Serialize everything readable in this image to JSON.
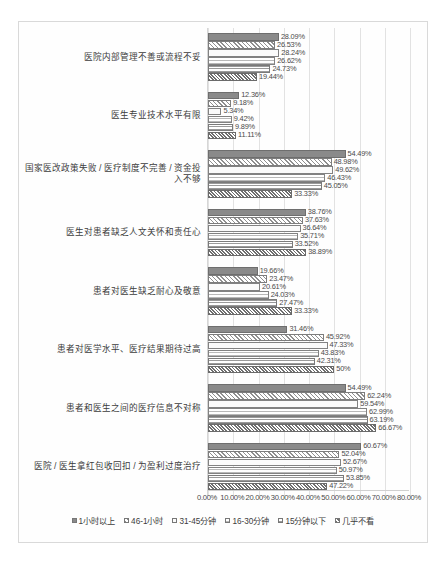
{
  "chart_data": {
    "type": "bar",
    "orientation": "horizontal",
    "title": "",
    "xlabel": "",
    "ylabel": "",
    "xlim": [
      0,
      80
    ],
    "grid": true,
    "legend_position": "bottom",
    "xticks": [
      "0.00%",
      "10.00%",
      "20.00%",
      "30.00%",
      "40.00%",
      "50.00%",
      "60.00%",
      "70.00%",
      "80.00%"
    ],
    "xtick_values": [
      0,
      10,
      20,
      30,
      40,
      50,
      60,
      70,
      80
    ],
    "categories": [
      "医院内部管理不善或流程不妥",
      "医生专业技术水平有限",
      "国家医改政策失败 / 医疗制度不完善 / 资金投入不够",
      "医生对患者缺乏人文关怀和责任心",
      "患者对医生缺乏耐心及敬意",
      "患者对医学水平、医疗结果期待过高",
      "患者和医生之间的医疗信息不对称",
      "医院 / 医生拿红包收回扣 / 为盈利过度治疗"
    ],
    "series": [
      {
        "name": "1小时以上",
        "values": [
          28.09,
          12.36,
          54.49,
          38.76,
          19.66,
          31.46,
          54.49,
          60.67
        ],
        "labels": [
          "28.09%",
          "12.36%",
          "54.49%",
          "38.76%",
          "19.66%",
          "31.46%",
          "54.49%",
          "60.67%"
        ]
      },
      {
        "name": "46-1小时",
        "values": [
          26.53,
          9.18,
          48.98,
          37.63,
          23.47,
          45.92,
          62.24,
          52.04
        ],
        "labels": [
          "26.53%",
          "9.18%",
          "48.98%",
          "37.63%",
          "23.47%",
          "45.92%",
          "62.24%",
          "52.04%"
        ]
      },
      {
        "name": "31-45分钟",
        "values": [
          28.24,
          5.34,
          49.62,
          36.64,
          20.61,
          47.33,
          59.54,
          52.67
        ],
        "labels": [
          "28.24%",
          "5.34%",
          "49.62%",
          "36.64%",
          "20.61%",
          "47.33%",
          "59.54%",
          "52.67%"
        ]
      },
      {
        "name": "16-30分钟",
        "values": [
          26.62,
          9.42,
          46.43,
          35.71,
          24.03,
          43.83,
          62.99,
          50.97
        ],
        "labels": [
          "26.62%",
          "9.42%",
          "46.43%",
          "35.71%",
          "24.03%",
          "43.83%",
          "62.99%",
          "50.97%"
        ]
      },
      {
        "name": "15分钟以下",
        "values": [
          24.73,
          9.89,
          45.05,
          33.52,
          27.47,
          42.31,
          63.19,
          53.85
        ],
        "labels": [
          "24.73%",
          "9.89%",
          "45.05%",
          "33.52%",
          "27.47%",
          "42.31%",
          "63.19%",
          "53.85%"
        ]
      },
      {
        "name": "几乎不看",
        "values": [
          19.44,
          11.11,
          33.33,
          38.89,
          33.33,
          50.0,
          66.67,
          47.22
        ],
        "labels": [
          "19.44%",
          "11.11%",
          "33.33%",
          "38.89%",
          "33.33%",
          "50%",
          "66.67%",
          "47.22%"
        ]
      }
    ]
  }
}
